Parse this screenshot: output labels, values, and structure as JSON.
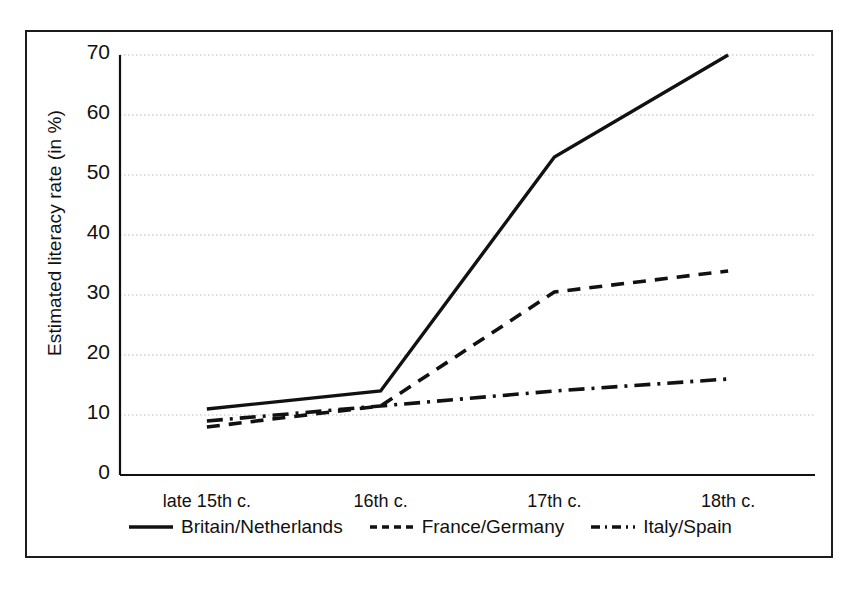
{
  "figure": {
    "y_axis_title": "Estimated literacy rate (in %)"
  },
  "chart_data": {
    "type": "line",
    "title": "",
    "xlabel": "",
    "ylabel": "Estimated literacy rate (in %)",
    "categories": [
      "late 15th c.",
      "16th c.",
      "17th c.",
      "18th c."
    ],
    "yticks": [
      0,
      10,
      20,
      30,
      40,
      50,
      60,
      70
    ],
    "ylim": [
      0,
      70
    ],
    "grid": true,
    "grid_style": "dotted",
    "grid_color": "#b9b9b9",
    "legend_position": "bottom",
    "series": [
      {
        "name": "Britain/Netherlands",
        "style": "solid",
        "color": "#111111",
        "values": [
          11,
          14,
          53,
          70
        ]
      },
      {
        "name": "France/Germany",
        "style": "dashed",
        "color": "#111111",
        "values": [
          8,
          11.5,
          30.5,
          34
        ]
      },
      {
        "name": "Italy/Spain",
        "style": "dashdot",
        "color": "#111111",
        "values": [
          9,
          11.5,
          14,
          16
        ]
      }
    ]
  },
  "y_tick_labels": [
    "70",
    "60",
    "50",
    "40",
    "30",
    "20",
    "10",
    "0"
  ],
  "x_tick_labels": [
    "late 15th c.",
    "16th c.",
    "17th c.",
    "18th c."
  ],
  "legend": [
    {
      "label": "Britain/Netherlands",
      "style": "solid"
    },
    {
      "label": "France/Germany",
      "style": "dashed"
    },
    {
      "label": "Italy/Spain",
      "style": "dashdot"
    }
  ]
}
